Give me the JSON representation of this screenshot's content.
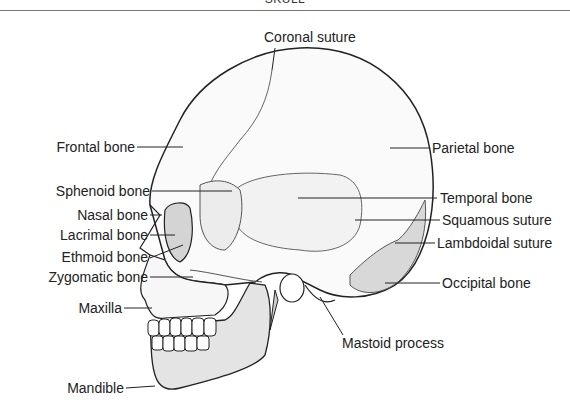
{
  "header": {
    "title": "SKULL"
  },
  "labels": {
    "coronal_suture": "Coronal suture",
    "frontal_bone": "Frontal bone",
    "parietal_bone": "Parietal bone",
    "sphenoid_bone": "Sphenoid bone",
    "nasal_bone": "Nasal bone",
    "lacrimal_bone": "Lacrimal bone",
    "ethmoid_bone": "Ethmoid bone",
    "zygomatic_bone": "Zygomatic bone",
    "maxilla": "Maxilla",
    "mandible": "Mandible",
    "temporal_bone": "Temporal bone",
    "squamous_suture": "Squamous suture",
    "lambdoidal_suture": "Lambdoidal suture",
    "occipital_bone": "Occipital bone",
    "mastoid_process": "Mastoid process"
  },
  "colors": {
    "outline": "#222222",
    "shade_light": "#f0f0f0",
    "shade_mid": "#dcdcdc",
    "shade_dark": "#bdbdbd"
  }
}
